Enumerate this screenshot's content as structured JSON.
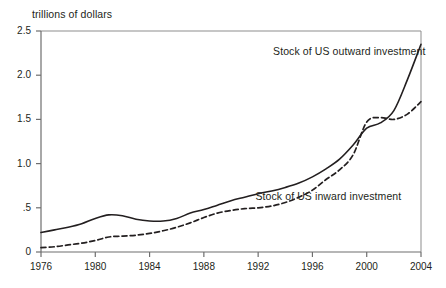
{
  "chart_data": {
    "type": "line",
    "title": "",
    "ylabel": "trillions of dollars",
    "xlabel": "",
    "xlim": [
      1976,
      2004
    ],
    "ylim": [
      0,
      2.5
    ],
    "grid": false,
    "legend_position": "inline-annotations",
    "x_ticks": [
      "1976",
      "1980",
      "1984",
      "1988",
      "1992",
      "1996",
      "2000",
      "2004"
    ],
    "x_tick_values": [
      1976,
      1980,
      1984,
      1988,
      1992,
      1996,
      2000,
      2004
    ],
    "y_ticks": [
      "0",
      ".5",
      "1.0",
      "1.5",
      "2.0",
      "2.5"
    ],
    "y_tick_values": [
      0,
      0.5,
      1.0,
      1.5,
      2.0,
      2.5
    ],
    "x": [
      1976,
      1977,
      1978,
      1979,
      1980,
      1981,
      1982,
      1983,
      1984,
      1985,
      1986,
      1987,
      1988,
      1989,
      1990,
      1991,
      1992,
      1993,
      1994,
      1995,
      1996,
      1997,
      1998,
      1999,
      2000,
      2001,
      2002,
      2003,
      2004
    ],
    "series": [
      {
        "name": "Stock of US outward investment",
        "style": "solid",
        "color": "#231f20",
        "label_x": 1993.1,
        "label_y": 2.26,
        "values": [
          0.22,
          0.25,
          0.28,
          0.32,
          0.38,
          0.42,
          0.41,
          0.37,
          0.35,
          0.35,
          0.38,
          0.44,
          0.48,
          0.53,
          0.58,
          0.62,
          0.66,
          0.69,
          0.73,
          0.78,
          0.85,
          0.94,
          1.05,
          1.21,
          1.4,
          1.46,
          1.6,
          1.95,
          2.35
        ]
      },
      {
        "name": "Stock of US inward investment",
        "style": "dashed",
        "color": "#231f20",
        "label_x": 1991.8,
        "label_y": 0.62,
        "values": [
          0.05,
          0.06,
          0.08,
          0.1,
          0.13,
          0.17,
          0.18,
          0.19,
          0.21,
          0.24,
          0.28,
          0.33,
          0.39,
          0.44,
          0.47,
          0.49,
          0.5,
          0.52,
          0.56,
          0.62,
          0.7,
          0.82,
          0.93,
          1.1,
          1.47,
          1.52,
          1.5,
          1.56,
          1.7
        ]
      }
    ]
  }
}
